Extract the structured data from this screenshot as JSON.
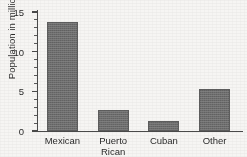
{
  "chart_data": {
    "type": "bar",
    "title": "",
    "xlabel": "",
    "ylabel": "Population in millions",
    "categories": [
      "Mexican",
      "Puerto\nRican",
      "Cuban",
      "Other"
    ],
    "values": [
      13.7,
      2.65,
      1.2,
      5.3
    ],
    "ylim": [
      0,
      15
    ],
    "ytick_labels": [
      "0",
      "5",
      "10",
      "15"
    ],
    "ytick_values": [
      0,
      5,
      10,
      15
    ],
    "minor_tick_interval": 1,
    "grid": false,
    "legend": null,
    "bar_color": "#6e6e6e",
    "axis_color": "#4a4a4a",
    "background_color": "#f6f5f3",
    "text_color": "#2b2b2b"
  }
}
